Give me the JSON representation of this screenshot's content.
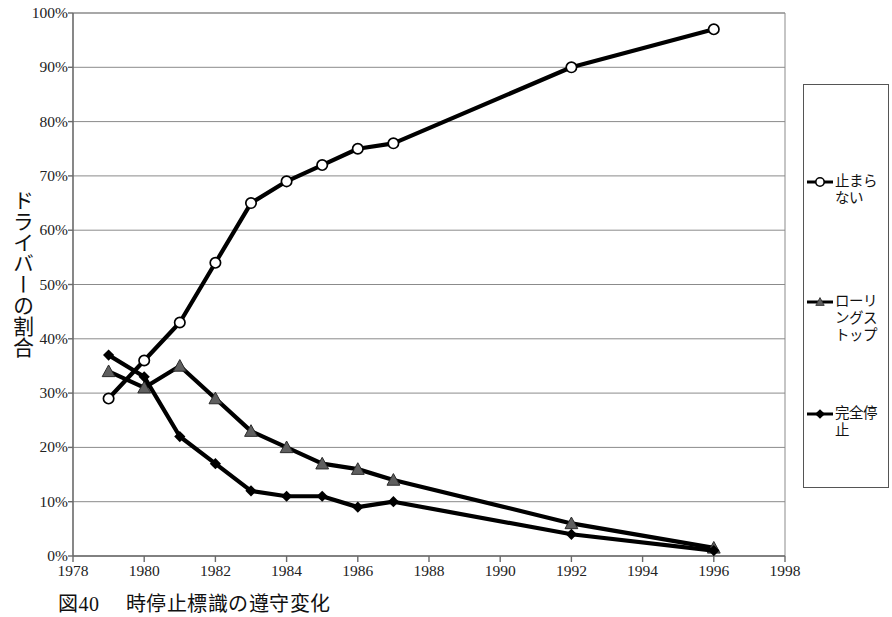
{
  "chart_data": {
    "type": "line",
    "title": "",
    "caption_number": "図40",
    "caption_text": "時停止標識の遵守変化",
    "xlabel": "",
    "ylabel": "ドライバーの割合",
    "xlim": [
      1978,
      1998
    ],
    "ylim": [
      0,
      100
    ],
    "y_unit": "%",
    "grid": "horizontal",
    "legend_position": "right",
    "xticks": [
      1978,
      1980,
      1982,
      1984,
      1986,
      1988,
      1990,
      1992,
      1994,
      1996,
      1998
    ],
    "xtick_labels": [
      "1978",
      "1980",
      "1982",
      "1984",
      "1986",
      "1988",
      "1990",
      "1992",
      "1994",
      "1996",
      "1998"
    ],
    "yticks": [
      0,
      10,
      20,
      30,
      40,
      50,
      60,
      70,
      80,
      90,
      100
    ],
    "ytick_labels": [
      "0%",
      "10%",
      "20%",
      "30%",
      "40%",
      "50%",
      "60%",
      "70%",
      "80%",
      "90%",
      "100%"
    ],
    "series": [
      {
        "name": "止まらない",
        "marker": "circle-open",
        "color": "#000000",
        "x": [
          1979,
          1980,
          1981,
          1982,
          1983,
          1984,
          1985,
          1986,
          1987,
          1992,
          1996
        ],
        "values": [
          29,
          36,
          43,
          54,
          65,
          69,
          72,
          75,
          76,
          90,
          97
        ]
      },
      {
        "name": "ローリングストップ",
        "marker": "triangle-filled",
        "color": "#595959",
        "x": [
          1979,
          1980,
          1981,
          1982,
          1983,
          1984,
          1985,
          1986,
          1987,
          1992,
          1996
        ],
        "values": [
          34,
          31,
          35,
          29,
          23,
          20,
          17,
          16,
          14,
          6,
          1.5
        ]
      },
      {
        "name": "完全停止",
        "marker": "diamond-filled",
        "color": "#000000",
        "x": [
          1979,
          1980,
          1981,
          1982,
          1983,
          1984,
          1985,
          1986,
          1987,
          1992,
          1996
        ],
        "values": [
          37,
          33,
          22,
          17,
          12,
          11,
          11,
          9,
          10,
          4,
          1
        ]
      }
    ]
  },
  "legend": {
    "entries": [
      {
        "label": "止まらない",
        "marker": "circle-open"
      },
      {
        "label": "ローリングストップ",
        "marker": "triangle-filled"
      },
      {
        "label": "完全停止",
        "marker": "diamond-filled"
      }
    ]
  }
}
